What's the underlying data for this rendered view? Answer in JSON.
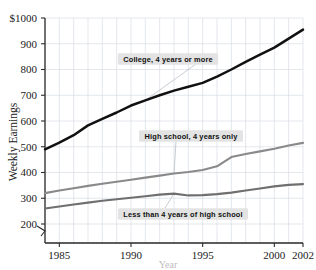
{
  "chart_data": {
    "type": "line",
    "title": "",
    "xlabel": "Year",
    "ylabel": "Weekly Earnings",
    "xlim": [
      1984,
      2002
    ],
    "ylim": [
      150,
      1000
    ],
    "grid": true,
    "legend_position": "inline-annotations",
    "y_axis_break": true,
    "y_ticks": [
      200,
      300,
      400,
      500,
      600,
      700,
      800,
      900,
      1000
    ],
    "y_tick_labels": [
      "200",
      "300",
      "400",
      "500",
      "600",
      "700",
      "800",
      "900",
      "$1000"
    ],
    "x_ticks": [
      1985,
      1990,
      1995,
      2000,
      2002
    ],
    "x_tick_labels": [
      "1985",
      "1990",
      "1995",
      "2000",
      "2002"
    ],
    "x": [
      1984,
      1985,
      1986,
      1987,
      1988,
      1989,
      1990,
      1991,
      1992,
      1993,
      1994,
      1995,
      1996,
      1997,
      1998,
      1999,
      2000,
      2001,
      2002
    ],
    "series": [
      {
        "name": "College, 4 years or more",
        "color": "#111111",
        "values": [
          490,
          516,
          545,
          583,
          608,
          633,
          660,
          680,
          700,
          718,
          733,
          748,
          772,
          800,
          830,
          858,
          885,
          920,
          955
        ]
      },
      {
        "name": "High school, 4 years only",
        "color": "#8a8a8a",
        "values": [
          320,
          330,
          339,
          348,
          356,
          364,
          372,
          380,
          388,
          396,
          402,
          410,
          424,
          460,
          472,
          482,
          492,
          505,
          515
        ]
      },
      {
        "name": "Less than 4 years of high school",
        "color": "#6f6f6f",
        "values": [
          260,
          268,
          276,
          283,
          290,
          296,
          302,
          308,
          314,
          318,
          311,
          312,
          316,
          322,
          330,
          338,
          346,
          352,
          355
        ]
      }
    ],
    "annotations": [
      {
        "text": "College, 4 years or more",
        "target_year": 1991,
        "target_value": 680
      },
      {
        "text": "High school, 4 years only",
        "target_year": 1993,
        "target_value": 396
      },
      {
        "text": "Less than 4 years of high school",
        "target_year": 1993,
        "target_value": 318
      }
    ]
  }
}
